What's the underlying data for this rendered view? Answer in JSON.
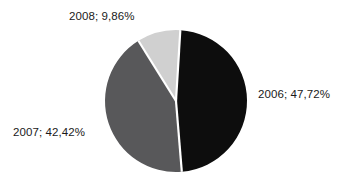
{
  "chart_data": {
    "type": "pie",
    "title": "",
    "subtitle": "",
    "xlabel": "",
    "ylabel": "",
    "legend_position": "none",
    "grid": false,
    "label_format": "{category}; {value}%",
    "decimal_separator": ",",
    "categories": [
      "2006",
      "2007",
      "2008"
    ],
    "values": [
      47.72,
      42.42,
      9.86
    ],
    "slices": [
      {
        "category": "2006",
        "value": 47.72,
        "value_text": "47,72%",
        "label": "2006; 47,72%",
        "color": "#0d0d0d",
        "start_angle_deg": 3.5,
        "end_angle_deg": 175.3
      },
      {
        "category": "2007",
        "value": 42.42,
        "value_text": "42,42%",
        "label": "2007; 42,42%",
        "color": "#58585a",
        "start_angle_deg": 175.3,
        "end_angle_deg": 328.0
      },
      {
        "category": "2008",
        "value": 9.86,
        "value_text": "9,86%",
        "label": "2008; 9,86%",
        "color": "#d0d0d0",
        "start_angle_deg": 328.0,
        "end_angle_deg": 363.5
      }
    ],
    "geometry": {
      "center_x": 176,
      "center_y": 101,
      "radius": 71,
      "separator_color": "#ffffff",
      "separator_width": 2.2
    },
    "background_color": "#ffffff",
    "label_color": "#1a1a1a"
  },
  "labels": {
    "slice_2006": "2006; 47,72%",
    "slice_2007": "2007; 42,42%",
    "slice_2008": "2008; 9,86%"
  }
}
